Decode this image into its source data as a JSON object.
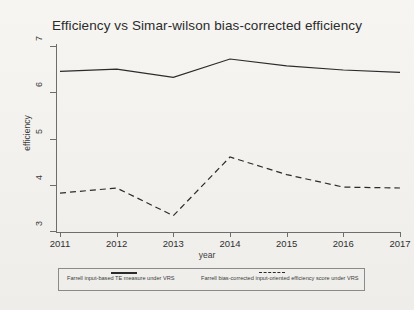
{
  "figure": {
    "title": "Efficiency vs Simar-wilson bias-corrected efficiency",
    "xlabel": "year",
    "ylabel": "efficiency"
  },
  "legend": {
    "entries": [
      {
        "label": "Farrell input-based TE measure under VRS",
        "style": "solid"
      },
      {
        "label": "Farrell bias-corrected input-oriented efficiency score under VRS",
        "style": "dashed"
      }
    ]
  },
  "chart_data": {
    "type": "line",
    "title": "Efficiency vs Simar-wilson bias-corrected efficiency",
    "xlabel": "year",
    "ylabel": "efficiency",
    "x": [
      2011,
      2012,
      2013,
      2014,
      2015,
      2016,
      2017
    ],
    "xticklabels": [
      "2011",
      "2012",
      "2013",
      "2014",
      "2015",
      "2016",
      "2017"
    ],
    "yticklabels": [
      "3",
      "4",
      "5",
      "6",
      "7"
    ],
    "yticks": [
      3,
      4,
      5,
      6,
      7
    ],
    "xlim": [
      2011,
      2017
    ],
    "ylim": [
      3,
      7
    ],
    "grid": false,
    "legend_position": "below-plot",
    "series": [
      {
        "name": "Farrell input-based TE measure under VRS",
        "style": "solid",
        "color": "#2b2b2b",
        "values": [
          6.45,
          6.5,
          6.32,
          6.72,
          6.57,
          6.48,
          6.43
        ]
      },
      {
        "name": "Farrell bias-corrected input-oriented efficiency score under VRS",
        "style": "dashed",
        "color": "#2b2b2b",
        "values": [
          3.82,
          3.93,
          3.33,
          4.6,
          4.22,
          3.95,
          3.93
        ]
      }
    ]
  }
}
